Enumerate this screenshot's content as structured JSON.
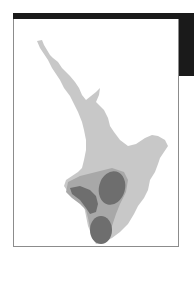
{
  "map": {
    "subject": "North Island, New Zealand",
    "colors": {
      "land": "#c8c8c8",
      "region_medium": "#a8a8a8",
      "region_dark": "#6e6e6e",
      "frame_border": "#8c8c8c",
      "header_bar": "#1a1a1a"
    },
    "regions": [
      {
        "name": "land"
      },
      {
        "name": "southern-medium-zone"
      },
      {
        "name": "dark-zone-northeast"
      },
      {
        "name": "dark-zone-west"
      },
      {
        "name": "dark-zone-south"
      }
    ]
  }
}
